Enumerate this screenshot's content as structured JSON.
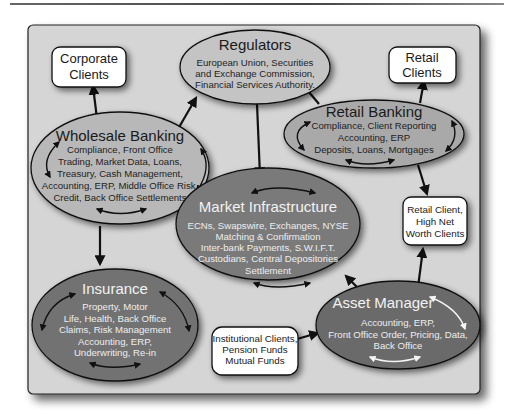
{
  "diagram": {
    "nodes": {
      "regulators": {
        "title": "Regulators",
        "lines": [
          "European Union, Securities",
          "and Exchange Commission,",
          "Financial Services Authority."
        ]
      },
      "corporate_clients": {
        "lines": [
          "Corporate",
          "Clients"
        ]
      },
      "retail_clients": {
        "lines": [
          "Retail",
          "Clients"
        ]
      },
      "wholesale_banking": {
        "title": "Wholesale Banking",
        "lines": [
          "Compliance, Front Office",
          "Trading, Market Data, Loans,",
          "Treasury, Cash Management,",
          "Accounting, ERP, Middle Office Risk,",
          "Credit, Back Office Settlements"
        ]
      },
      "retail_banking": {
        "title": "Retail Banking",
        "lines": [
          "Compliance, Client Reporting",
          "Accounting, ERP",
          "Deposits, Loans, Mortgages"
        ]
      },
      "market_infrastructure": {
        "title": "Market Infrastructure",
        "lines": [
          "ECNs, Swapswire, Exchanges, NYSE",
          "Matching & Confirmation",
          "Inter-bank Payments, S.W.I.F.T.",
          "Custodians, Central Depositories",
          "Settlement"
        ]
      },
      "retail_hnw_clients": {
        "lines": [
          "Retail Client,",
          "High Net",
          "Worth Clients"
        ]
      },
      "insurance": {
        "title": "Insurance",
        "lines": [
          "Property, Motor",
          "Life, Health, Back Office",
          "Claims, Risk Management",
          "Accounting, ERP,",
          "Underwriting, Re-in"
        ]
      },
      "asset_manager": {
        "title": "Asset Manager",
        "lines": [
          "Accounting, ERP,",
          "Front Office Order, Pricing, Data,",
          "Back Office"
        ]
      },
      "institutional_clients": {
        "lines": [
          "Institutional Clients,",
          "Pension Funds",
          "Mutual Funds"
        ]
      }
    },
    "edges": [
      {
        "from": "wholesale_banking",
        "to": "corporate_clients"
      },
      {
        "from": "wholesale_banking",
        "to": "regulators"
      },
      {
        "from": "retail_banking",
        "to": "regulators"
      },
      {
        "from": "retail_banking",
        "to": "retail_clients"
      },
      {
        "from": "regulators",
        "to": "market_infrastructure"
      },
      {
        "from": "wholesale_banking",
        "to": "insurance"
      },
      {
        "from": "retail_banking",
        "to": "retail_hnw_clients"
      },
      {
        "from": "asset_manager",
        "to": "retail_hnw_clients"
      },
      {
        "from": "asset_manager",
        "to": "market_infrastructure"
      },
      {
        "from": "institutional_clients",
        "to": "asset_manager"
      }
    ],
    "colors": {
      "panel": "#d4d4d4",
      "light_ellipse": "#bdbdbd",
      "mid_ellipse": "#a3a3a3",
      "dark_ellipse": "#6e6e6e",
      "box": "#ffffff",
      "stroke": "#1a1a1a"
    }
  }
}
